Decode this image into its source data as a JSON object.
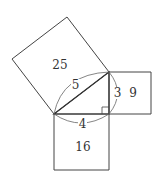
{
  "diagram": {
    "type": "pythagorean-theorem",
    "colors": {
      "stroke": "#444444",
      "background": "#ffffff",
      "text": "#333333"
    },
    "triangle": {
      "vertices": {
        "A": [
          54,
          114
        ],
        "B": [
          109,
          114
        ],
        "C": [
          109,
          72
        ]
      },
      "right_angle_at": "B"
    },
    "side_labels": {
      "hypotenuse": "5",
      "vertical_leg": "3",
      "horizontal_leg": "4"
    },
    "square_labels": {
      "hypotenuse_square": "25",
      "vertical_leg_square": "9",
      "horizontal_leg_square": "16"
    }
  }
}
